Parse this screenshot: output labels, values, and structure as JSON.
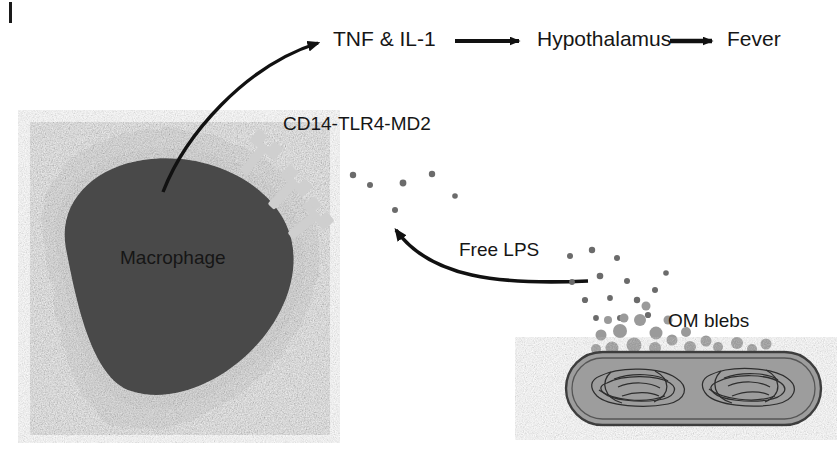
{
  "figure": {
    "type": "biological-pathway-diagram",
    "edge_marker": "|",
    "background_color": "#ffffff"
  },
  "labels": {
    "cytokines": "TNF & IL-1",
    "hypothalamus": "Hypothalamus",
    "fever": "Fever",
    "receptor": "CD14-TLR4-MD2",
    "macrophage": "Macrophage",
    "free_lps": "Free LPS",
    "om_blebs": "OM blebs"
  },
  "colors": {
    "text": "#161616",
    "arrow": "#111111",
    "macrophage_body": "#4a4a4a",
    "cytoplasm": "#e8e8e8",
    "receptor": "#cfcfcf",
    "bleb": "#9a9a9a",
    "lps_dot": "#6b6b6b",
    "bacterium_fill": "#9d9d9d",
    "bacterium_outline": "#3d3d3d"
  },
  "arrows": {
    "macrophage_to_cytokines": "curved",
    "cytokines_to_hypothalamus": "straight",
    "hypothalamus_to_fever": "straight",
    "lps_to_receptor": "curved"
  },
  "elements": {
    "receptor_count": 3,
    "bacterium_nucleoid_count": 2
  }
}
